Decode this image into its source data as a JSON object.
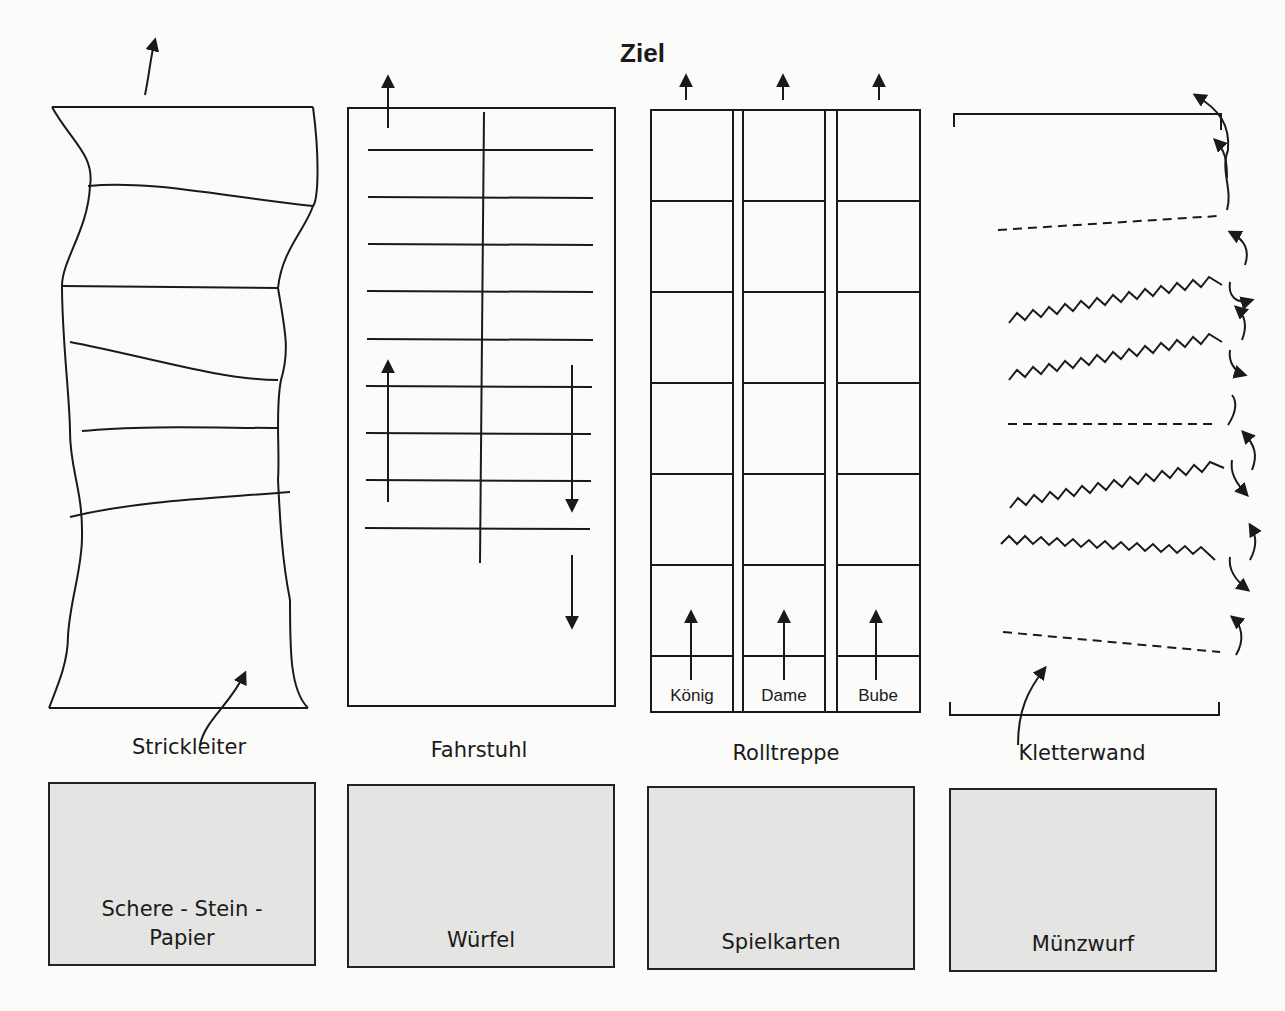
{
  "goal": {
    "label": "Ziel"
  },
  "tracks": [
    {
      "id": "strickleiter",
      "label": "Strickleiter",
      "game": "Schere - Stein -\nPapier"
    },
    {
      "id": "fahrstuhl",
      "label": "Fahrstuhl",
      "game": "Würfel"
    },
    {
      "id": "rolltreppe",
      "label": "Rolltreppe",
      "game": "Spielkarten",
      "lanes": [
        "König",
        "Dame",
        "Bube"
      ]
    },
    {
      "id": "kletterwand",
      "label": "Kletterwand",
      "game": "Münzwurf"
    }
  ],
  "colors": {
    "line": "#1a1a1a",
    "card_fill": "#e4e4e2",
    "paper": "#fbfbfa"
  }
}
